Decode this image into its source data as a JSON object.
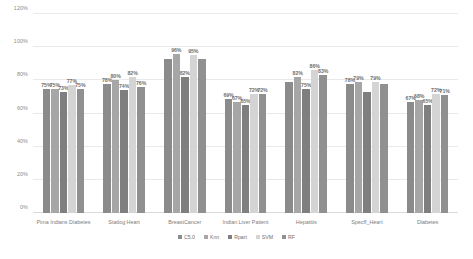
{
  "chart_data": {
    "type": "bar",
    "title": "",
    "xlabel": "",
    "ylabel": "",
    "ylim": [
      0,
      120
    ],
    "ytick_labels": [
      "0%",
      "20%",
      "40%",
      "60%",
      "80%",
      "100%",
      "120%"
    ],
    "ytick_values": [
      0,
      20,
      40,
      60,
      80,
      100,
      120
    ],
    "grid": true,
    "legend_position": "bottom",
    "categories": [
      "Pima Indians Diabetes",
      "Statlog Heart",
      "BreastCancer",
      "Indian Liver Patient",
      "Hepatitis",
      "Specff_Heart",
      "Diabetes"
    ],
    "series": [
      {
        "name": "C5.0",
        "color": "#8b8b8b",
        "values": [
          75,
          78,
          93,
          69,
          79,
          78,
          67
        ],
        "labels": [
          "75%",
          "78%",
          "",
          "69%",
          "",
          "78%",
          "67%"
        ]
      },
      {
        "name": "Knn",
        "color": "#a6a6a6",
        "values": [
          75,
          80,
          96,
          67,
          82,
          79,
          68
        ],
        "labels": [
          "75%",
          "80%",
          "96%",
          "67%",
          "82%",
          "79%",
          "68%"
        ]
      },
      {
        "name": "Rpart",
        "color": "#7f7f7f",
        "values": [
          73,
          74,
          82,
          65,
          75,
          73,
          65
        ],
        "labels": [
          "73%",
          "74%",
          "82%",
          "65%",
          "75%",
          "",
          "65%"
        ]
      },
      {
        "name": "SVM",
        "color": "#d4d4d4",
        "values": [
          77,
          82,
          95,
          72,
          86,
          79,
          72
        ],
        "labels": [
          "77%",
          "82%",
          "95%",
          "72%",
          "86%",
          "79%",
          "72%"
        ]
      },
      {
        "name": "RF",
        "color": "#909090",
        "values": [
          75,
          76,
          93,
          72,
          83,
          78,
          71
        ],
        "labels": [
          "75%",
          "76%",
          "",
          "72%",
          "83%",
          "",
          "71%"
        ]
      }
    ]
  }
}
